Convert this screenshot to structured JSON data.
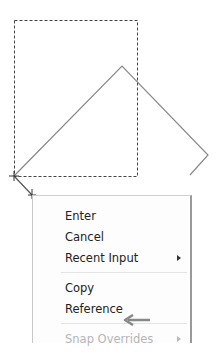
{
  "canvas": {
    "dashed_rect": {
      "x": 14,
      "y": 20,
      "w": 123,
      "h": 156,
      "color": "#444444"
    },
    "diamond": {
      "points": "14,176 122,66 208,155 100,262",
      "color": "#888888"
    }
  },
  "context_menu": {
    "items": [
      {
        "label": "Enter",
        "top": 10,
        "disabled": false,
        "submenu": false
      },
      {
        "label": "Cancel",
        "top": 31,
        "disabled": false,
        "submenu": false
      },
      {
        "label": "Recent Input",
        "top": 52,
        "disabled": false,
        "submenu": true
      },
      {
        "label": "Copy",
        "top": 82,
        "disabled": false,
        "submenu": false
      },
      {
        "label": "Reference",
        "top": 103,
        "disabled": false,
        "submenu": false
      },
      {
        "label": "Snap Overrides",
        "top": 133,
        "disabled": true,
        "submenu": true
      }
    ]
  },
  "annotation": {
    "icon": "left-arrow-icon",
    "color": "#888888"
  }
}
